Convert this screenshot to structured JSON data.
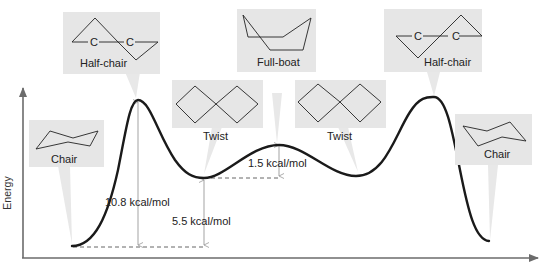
{
  "diagram": {
    "type": "energy-diagram",
    "y_axis_label": "Energy",
    "colors": {
      "curve": "#1a1a1a",
      "axis": "#6b6b6b",
      "callout_box": "#e6e6e6",
      "guide_line": "#555555",
      "arrow": "#999999"
    },
    "conformations": [
      {
        "id": "chair-left",
        "label": "Chair",
        "position": "minimum"
      },
      {
        "id": "half-chair-left",
        "label": "Half-chair",
        "position": "maximum"
      },
      {
        "id": "twist-left",
        "label": "Twist",
        "position": "local-minimum"
      },
      {
        "id": "full-boat",
        "label": "Full-boat",
        "position": "local-maximum"
      },
      {
        "id": "twist-right",
        "label": "Twist",
        "position": "local-minimum"
      },
      {
        "id": "half-chair-right",
        "label": "Half-chair",
        "position": "maximum"
      },
      {
        "id": "chair-right",
        "label": "Chair",
        "position": "minimum"
      }
    ],
    "half_chair_atom_labels": [
      "C",
      "C"
    ],
    "energy_gaps": [
      {
        "label": "10.8 kcal/mol",
        "from": "Chair",
        "to": "Half-chair",
        "value": 10.8
      },
      {
        "label": "5.5 kcal/mol",
        "from": "Chair",
        "to": "Twist",
        "value": 5.5
      },
      {
        "label": "1.5 kcal/mol",
        "from": "Twist",
        "to": "Full-boat",
        "value": 1.5
      }
    ]
  }
}
